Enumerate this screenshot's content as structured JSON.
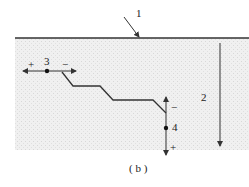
{
  "figure": {
    "caption": "( b )",
    "labels": {
      "surface": "1",
      "depth": "2",
      "point_start": "3",
      "point_end": "4",
      "plus_left": "+",
      "minus_right": "−",
      "minus_up": "−",
      "plus_down": "+"
    },
    "colors": {
      "line": "#333333",
      "ground": "#ececec"
    }
  }
}
